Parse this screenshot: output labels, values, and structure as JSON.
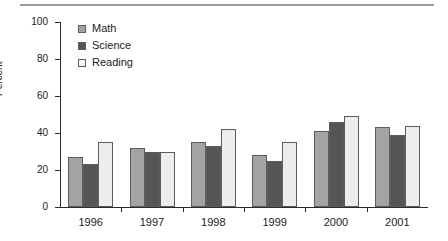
{
  "chart_data": {
    "type": "bar",
    "title": "",
    "xlabel": "",
    "ylabel": "Percent",
    "categories": [
      "1996",
      "1997",
      "1998",
      "1999",
      "2000",
      "2001"
    ],
    "ylim": [
      0,
      100
    ],
    "yticks": [
      0,
      20,
      40,
      60,
      80,
      100
    ],
    "grid": false,
    "legend_position": "top-left",
    "series": [
      {
        "name": "Math",
        "color": "#a3a3a3",
        "values": [
          27,
          32,
          35,
          28,
          41,
          43
        ]
      },
      {
        "name": "Science",
        "color": "#555555",
        "values": [
          23,
          30,
          33,
          25,
          46,
          39
        ]
      },
      {
        "name": "Reading",
        "color": "#ededed",
        "values": [
          35,
          30,
          42,
          35,
          49,
          44
        ]
      }
    ]
  },
  "legend": {
    "items": [
      {
        "label": "Math"
      },
      {
        "label": "Science"
      },
      {
        "label": "Reading"
      }
    ]
  }
}
